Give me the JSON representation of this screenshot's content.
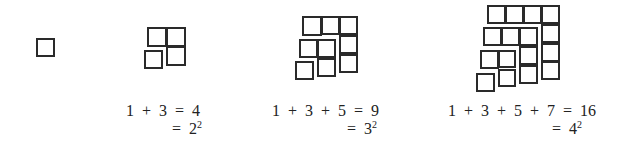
{
  "groups": [
    {
      "id": "n1",
      "squares": [
        [
          36,
          38,
          19
        ]
      ],
      "equation_line1": "",
      "equation_line2_prefix": "",
      "equation_line2_base": "",
      "equation_line2_exp": ""
    },
    {
      "id": "n2",
      "squares": [
        [
          147,
          27,
          20
        ],
        [
          166,
          27,
          20
        ],
        [
          166,
          46,
          20
        ],
        [
          144,
          50,
          19
        ]
      ],
      "line1": {
        "x": 126,
        "y": 102,
        "text": "1  +  3  =  4"
      },
      "line2": {
        "x": 172,
        "y": 120,
        "prefix": "=  ",
        "base": "2",
        "exp": "2"
      }
    },
    {
      "id": "n3",
      "squares": [
        [
          302,
          16,
          20
        ],
        [
          321,
          16,
          19
        ],
        [
          339,
          16,
          19
        ],
        [
          339,
          35,
          19
        ],
        [
          339,
          54,
          19
        ],
        [
          299,
          39,
          19
        ],
        [
          317,
          39,
          19
        ],
        [
          317,
          58,
          19
        ],
        [
          295,
          61,
          19
        ]
      ],
      "line1": {
        "x": 272,
        "y": 102,
        "text": "1  +  3  +  5  =  9"
      },
      "line2": {
        "x": 347,
        "y": 120,
        "prefix": "=  ",
        "base": "3",
        "exp": "2"
      }
    },
    {
      "id": "n4",
      "squares": [
        [
          487,
          5,
          19
        ],
        [
          505,
          5,
          19
        ],
        [
          523,
          5,
          19
        ],
        [
          541,
          5,
          19
        ],
        [
          541,
          24,
          19
        ],
        [
          541,
          43,
          19
        ],
        [
          541,
          61,
          19
        ],
        [
          483,
          27,
          19
        ],
        [
          501,
          27,
          19
        ],
        [
          519,
          27,
          19
        ],
        [
          519,
          46,
          19
        ],
        [
          519,
          65,
          19
        ],
        [
          480,
          50,
          19
        ],
        [
          498,
          50,
          18
        ],
        [
          498,
          69,
          18
        ],
        [
          476,
          73,
          19
        ]
      ],
      "line1": {
        "x": 448,
        "y": 102,
        "text": "1  +  3  +  5  +  7  =  16"
      },
      "line2": {
        "x": 552,
        "y": 120,
        "prefix": "=  ",
        "base": "4",
        "exp": "2"
      }
    }
  ],
  "labels": {
    "g2_line1": "1 + 3 = 4",
    "g2_line2": "= 2²",
    "g3_line1": "1 + 3 + 5 = 9",
    "g3_line2": "= 3²",
    "g4_line1": "1 + 3 + 5 + 7 = 16",
    "g4_line2": "= 4²"
  },
  "text": {
    "g2": {
      "l1": "1  +  3  =  4",
      "l2_prefix": "=  ",
      "l2_base": "2",
      "l2_exp": "2"
    },
    "g3": {
      "l1": "1  +  3  +  5  =  9",
      "l2_prefix": "=  ",
      "l2_base": "3",
      "l2_exp": "2"
    },
    "g4": {
      "l1": "1  +  3  +  5  +  7  =  16",
      "l2_prefix": "=  ",
      "l2_base": "4",
      "l2_exp": "2"
    }
  },
  "colors": {
    "stroke": "#2a2a2a",
    "text": "#222222",
    "background": "#ffffff"
  }
}
